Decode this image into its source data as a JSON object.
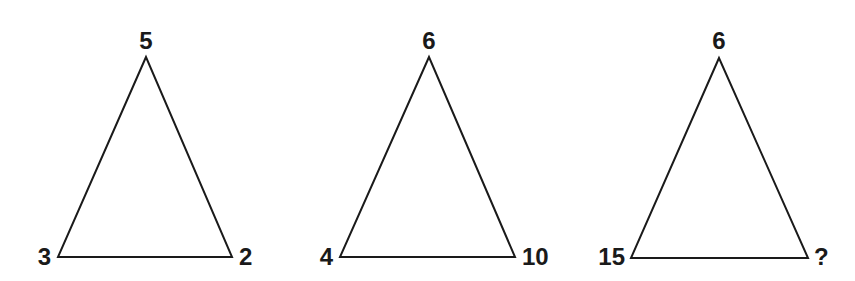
{
  "puzzle": {
    "triangles": [
      {
        "top": "5",
        "left": "3",
        "right": "2"
      },
      {
        "top": "6",
        "left": "4",
        "right": "10"
      },
      {
        "top": "6",
        "left": "15",
        "right": "?"
      }
    ]
  }
}
